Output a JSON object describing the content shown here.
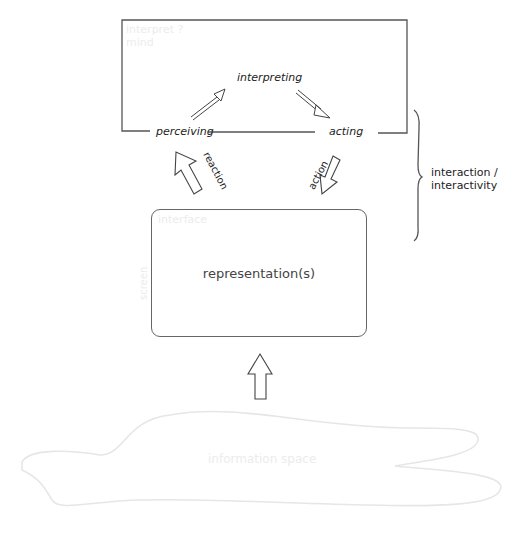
{
  "diagram": {
    "top_box": {
      "faint_label_line1": "interpret ?",
      "faint_label_line2": "mind",
      "nodes": {
        "interpreting": "interpreting",
        "perceiving": "perceiving",
        "acting": "acting"
      }
    },
    "arrows": {
      "reaction_label": "reaction",
      "action_label": "action"
    },
    "bracket_label": {
      "line1": "interaction /",
      "line2": "interactivity"
    },
    "representation_box": {
      "faint_label": "interface",
      "faint_vertical_label": "screen",
      "label": "representation(s)"
    },
    "information_space": {
      "label": "information space"
    },
    "colors": {
      "line": "#555555",
      "faint": "#ececec",
      "background": "#ffffff"
    }
  }
}
